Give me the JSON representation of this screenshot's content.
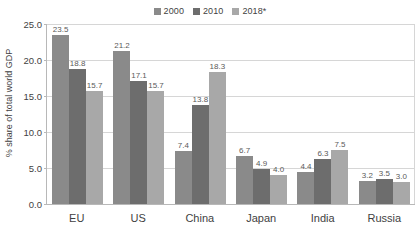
{
  "chart_data": {
    "type": "bar",
    "title": "",
    "subtitle": "",
    "xlabel": "",
    "ylabel": "% share of total world GDP",
    "ylim": [
      0,
      25
    ],
    "ytick_step": 5,
    "ytick_labels": [
      "0.0",
      "5.0",
      "10.0",
      "15.0",
      "20.0",
      "25.0"
    ],
    "ytick_values": [
      0,
      5,
      10,
      15,
      20,
      25
    ],
    "grid": "horizontal",
    "legend_position": "top-center",
    "categories": [
      "EU",
      "US",
      "China",
      "Japan",
      "India",
      "Russia"
    ],
    "series": [
      {
        "name": "2000",
        "color": "#8a8a8a",
        "values": [
          23.5,
          21.2,
          7.4,
          6.7,
          4.4,
          3.2
        ],
        "labels": [
          "23.5",
          "21.2",
          "7.4",
          "6.7",
          "4.4",
          "3.2"
        ]
      },
      {
        "name": "2010",
        "color": "#6d6d6d",
        "values": [
          18.8,
          17.1,
          13.8,
          4.9,
          6.3,
          3.5
        ],
        "labels": [
          "18.8",
          "17.1",
          "13.8",
          "4.9",
          "6.3",
          "3.5"
        ]
      },
      {
        "name": "2018*",
        "color": "#a8a8a8",
        "values": [
          15.7,
          15.7,
          18.3,
          4.0,
          7.5,
          3.0
        ],
        "labels": [
          "15.7",
          "15.7",
          "18.3",
          "4.0",
          "7.5",
          "3.0"
        ]
      }
    ]
  },
  "axis": {
    "y_title": "% share of total world GDP"
  },
  "colors": {
    "series_2000": "#8a8a8a",
    "series_2010": "#6d6d6d",
    "series_2018": "#a8a8a8",
    "gridline": "#d6d6d6",
    "axis_line": "#b8b8b8",
    "text": "#3f3f3f",
    "label_text": "#5a5a5a",
    "background": "#ffffff"
  }
}
